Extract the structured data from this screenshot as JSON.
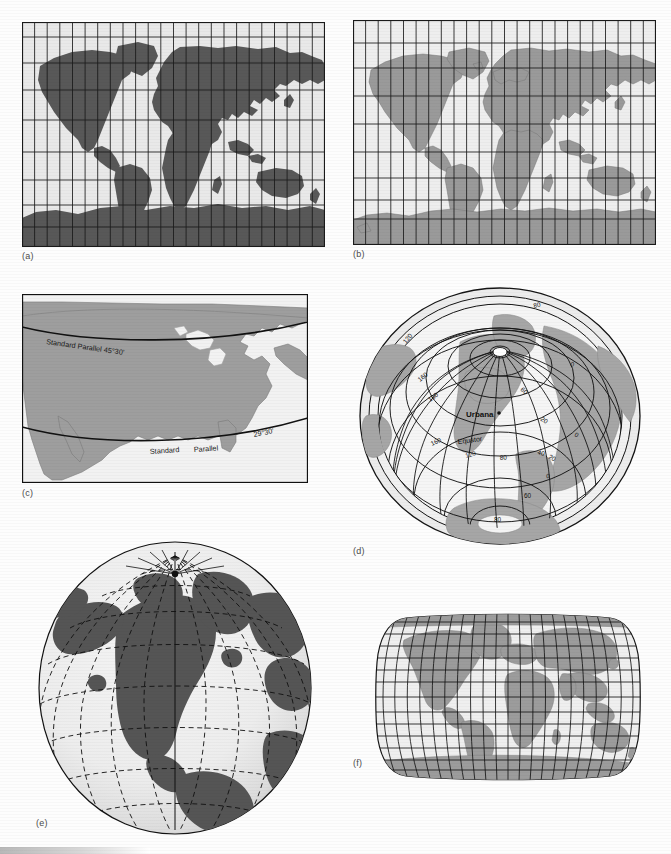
{
  "figure": {
    "background_color": "#fdfdfd",
    "panels": [
      {
        "id": "a",
        "label": "(a)",
        "projection": "Mercator",
        "land_color": "#585858",
        "ocean_color": "#e9e9e9",
        "grid_color": "#1a1a1a",
        "meridian_count": 24,
        "parallel_count": 9
      },
      {
        "id": "b",
        "label": "(b)",
        "projection": "Cylindrical equal-area",
        "land_color": "#9a9a9a",
        "ocean_color": "#eeeeee",
        "grid_color": "#1a1a1a",
        "meridian_count": 24,
        "parallel_count": 9
      },
      {
        "id": "c",
        "label": "(c)",
        "projection": "Lambert conformal conic",
        "land_color": "#9e9e9e",
        "ocean_color": "#f2f2f2",
        "grid_color": "#111111",
        "annotations": [
          {
            "text": "Standard Parallel 45°30'",
            "kind": "standard-parallel-upper"
          },
          {
            "text": "Standard",
            "kind": "standard-parallel-lower-part1"
          },
          {
            "text": "Parallel",
            "kind": "standard-parallel-lower-part2"
          },
          {
            "text": "29°30'",
            "kind": "standard-parallel-lower-value"
          }
        ]
      },
      {
        "id": "d",
        "label": "(d)",
        "projection": "Oblique azimuthal (tilted perspective)",
        "land_color": "#a6a6a6",
        "ocean_color": "#f0f0f0",
        "grid_color": "#141414",
        "place_label": "Urbana",
        "equator_label": "Equator",
        "graticule_labels": [
          "80",
          "120",
          "160",
          "180",
          "160",
          "120",
          "80",
          "60",
          "40",
          "20",
          "0",
          "0",
          "0",
          "20",
          "60",
          "80"
        ]
      },
      {
        "id": "e",
        "label": "(e)",
        "projection": "Orthographic (globe, North America centered)",
        "land_color": "#555555",
        "ocean_color": "#ececec",
        "grid_color": "#111111",
        "grid_style": "dashed"
      },
      {
        "id": "f",
        "label": "(f)",
        "projection": "Robinson",
        "land_color": "#9c9c9c",
        "ocean_color": "#efefef",
        "grid_color": "#151515",
        "meridian_count": 24,
        "parallel_count": 13
      }
    ]
  }
}
